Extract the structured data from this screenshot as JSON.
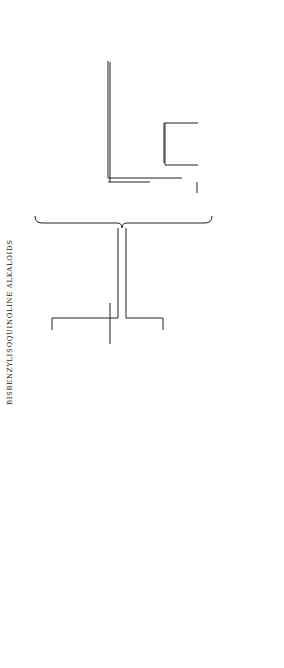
{
  "title": "BISBENZYLISOQUINOLINE ALKALOIDS",
  "root": "Norcoclaurine",
  "series": {
    "A": {
      "heading": "Series A",
      "items": [
        "Magnoline",
        "Dauricine",
        "Magnolamine"
      ]
    },
    "B": {
      "heading": "Series B",
      "items": [
        "Oxyacanthine",
        "Repandine",
        "Aromoline",
        "Daphnoline",
        "Daphnandrine",
        "Cepharanthine",
        "Berbamine",
        "Tetrandrine",
        "Isotetrandrine",
        "Pheanthine",
        "Fangchinoline",
        "Epistephanine",
        "Hypoepistephanine"
      ]
    },
    "C": {
      "heading": "Series C",
      "items": [
        "Bebeerine",
        "Curine",
        "Chondrofoline",
        "Tubocurarine",
        "Chondocurine"
      ]
    },
    "D": {
      "heading": "Series D",
      "items": [
        "Isochondodendrine",
        "Methylisochondodendrine",
        "Neoprotocuridine",
        "Protocuridine",
        "Insularine"
      ]
    },
    "E": {
      "heading": "Series E",
      "items": [
        "Micranthine",
        "Menisarine",
        "Normenisarine"
      ]
    },
    "F": {
      "heading": "Series F",
      "items": [
        "Trilobine",
        "Isotrilobine"
      ]
    }
  },
  "reactions": {
    "root_to_A": "−2H",
    "root_to_C": "−4H",
    "root_to_D": "−4H",
    "A_to_B": "−2H",
    "B_to_E": "−2H",
    "B_to_F": "−H₂O"
  }
}
